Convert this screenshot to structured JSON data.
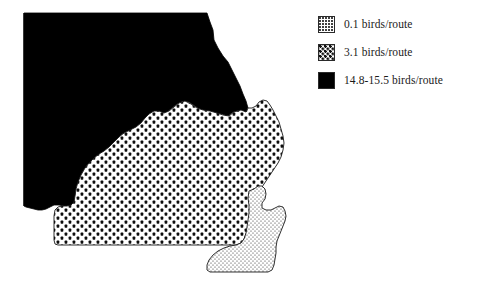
{
  "figure": {
    "type": "choropleth-map",
    "region": "Missouri",
    "measure": "birds/route"
  },
  "legend": {
    "items": [
      {
        "swatch": "light-stipple-swatch",
        "label": "0.1 birds/route",
        "value": "0.1",
        "unit": "birds/route",
        "pattern": "light-stipple",
        "color": "#ffffff"
      },
      {
        "swatch": "medium-dot-swatch",
        "label": "3.1 birds/route",
        "value": "3.1",
        "unit": "birds/route",
        "pattern": "medium-dots",
        "color": "#111111"
      },
      {
        "swatch": "solid-black-swatch",
        "label": "14.8-15.5 birds/route",
        "value": "14.8-15.5",
        "unit": "birds/route",
        "pattern": "solid",
        "color": "#000000"
      }
    ]
  },
  "map": {
    "regions": [
      {
        "name": "northern-region",
        "class": "14.8-15.5 birds/route",
        "pattern": "solid"
      },
      {
        "name": "central-southern-region",
        "class": "3.1 birds/route",
        "pattern": "medium-dots"
      },
      {
        "name": "southeast-bootheel-region",
        "class": "0.1 birds/route",
        "pattern": "light-stipple"
      }
    ],
    "outline_color": "#000000"
  }
}
